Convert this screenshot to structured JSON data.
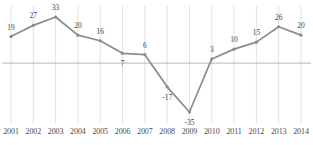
{
  "chart_data": {
    "type": "line",
    "title": "",
    "xlabel": "",
    "ylabel": "",
    "categories": [
      "2001",
      "2002",
      "2003",
      "2004",
      "2005",
      "2006",
      "2007",
      "2008",
      "2009",
      "2010",
      "2011",
      "2012",
      "2013",
      "2014"
    ],
    "values": [
      19,
      27,
      33,
      20,
      16,
      7,
      6,
      -17,
      -35,
      3,
      10,
      15,
      26,
      20
    ],
    "point_labels": [
      "19",
      "27",
      "33",
      "20",
      "16",
      "7",
      "6",
      "-17",
      "-35",
      "3",
      "10",
      "15",
      "26",
      "20"
    ],
    "ylim": [
      -40,
      38
    ],
    "grid": "vertical",
    "zero_line": true,
    "legend": "none",
    "series": [
      {
        "name": "series-1",
        "values": [
          19,
          27,
          33,
          20,
          16,
          7,
          6,
          -17,
          -35,
          3,
          10,
          15,
          26,
          20
        ]
      }
    ]
  },
  "style": {
    "line_color": "#8c8c8c",
    "marker_color": "#8c8c8c",
    "grid_color": "#e2e2e2",
    "zero_line_color": "#b5b5b5",
    "label_color": "#3f3f3f",
    "tick_color": "#4a4a4a",
    "background": "#ffffff"
  },
  "header": {
    "truncated_title": ""
  }
}
